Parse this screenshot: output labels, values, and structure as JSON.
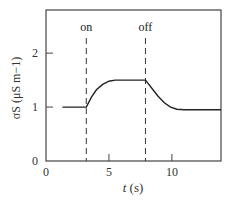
{
  "chart_data": {
    "type": "line",
    "title": "",
    "xlabel": "t (s)",
    "ylabel": "σS (μS m−1)",
    "xlim": [
      0,
      13.9
    ],
    "ylim": [
      0,
      2.8
    ],
    "xticks": [
      0,
      5,
      10
    ],
    "yticks": [
      0,
      1,
      2
    ],
    "grid": false,
    "legend": null,
    "annotations": [
      {
        "label": "on",
        "x": 3.2,
        "style": "dashed-vertical"
      },
      {
        "label": "off",
        "x": 7.9,
        "style": "dashed-vertical"
      }
    ],
    "series": [
      {
        "name": "σS",
        "x": [
          1.3,
          3.2,
          3.6,
          4.0,
          4.5,
          5.0,
          5.5,
          6.0,
          7.9,
          8.4,
          8.9,
          9.4,
          9.9,
          10.4,
          11.0,
          13.9
        ],
        "y": [
          1.0,
          1.0,
          1.18,
          1.32,
          1.42,
          1.48,
          1.5,
          1.5,
          1.5,
          1.35,
          1.2,
          1.08,
          1.0,
          0.96,
          0.95,
          0.95
        ]
      }
    ]
  },
  "axes": {
    "x_tick_labels": [
      "0",
      "5",
      "10"
    ],
    "y_tick_labels": [
      "0",
      "1",
      "2"
    ],
    "x_label_italic": "t",
    "x_label_unit": " (s)",
    "y_label": "σS (μS m−1)"
  },
  "annotations": {
    "on": "on",
    "off": "off"
  }
}
